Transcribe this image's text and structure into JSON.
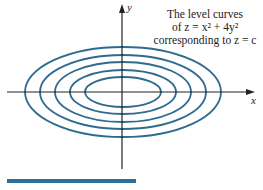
{
  "figure": {
    "caption_lines": [
      "The level curves",
      "of z = x² + 4y²",
      "corresponding to z = c"
    ],
    "x_label": "x",
    "y_label": "y",
    "curve_color": "#2f6a8f",
    "axis_color": "#222222",
    "bar_color": "#2a7099",
    "center": [
      123,
      92
    ],
    "ellipses": [
      {
        "rx": 38,
        "ry": 15
      },
      {
        "rx": 53,
        "ry": 22
      },
      {
        "rx": 68,
        "ry": 30
      },
      {
        "rx": 83,
        "ry": 37
      },
      {
        "rx": 98,
        "ry": 45
      }
    ]
  }
}
